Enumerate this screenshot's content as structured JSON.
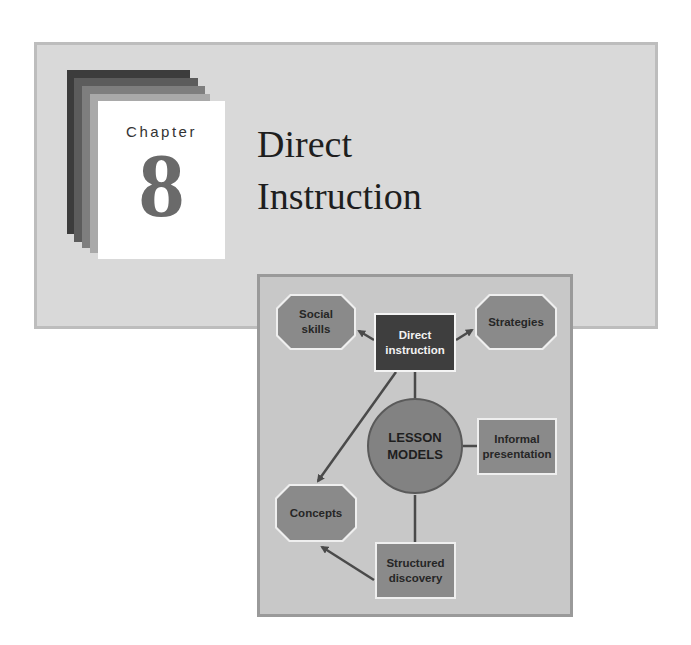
{
  "chapter": {
    "label": "Chapter",
    "number": "8",
    "title_line1": "Direct",
    "title_line2": "Instruction"
  },
  "diagram": {
    "center": {
      "label_line1": "LESSON",
      "label_line2": "MODELS"
    },
    "nodes": [
      {
        "id": "social-skills",
        "line1": "Social",
        "line2": "skills",
        "shape": "octagon"
      },
      {
        "id": "direct-instruction",
        "line1": "Direct",
        "line2": "instruction",
        "shape": "rect-dark"
      },
      {
        "id": "strategies",
        "line1": "Strategies",
        "line2": "",
        "shape": "octagon"
      },
      {
        "id": "informal-presentation",
        "line1": "Informal",
        "line2": "presentation",
        "shape": "rect"
      },
      {
        "id": "concepts",
        "line1": "Concepts",
        "line2": "",
        "shape": "octagon"
      },
      {
        "id": "structured-discovery",
        "line1": "Structured",
        "line2": "discovery",
        "shape": "rect"
      }
    ]
  },
  "colors": {
    "banner_bg": "#d9d9d9",
    "diagram_bg": "#c8c8c8",
    "node_fill": "#8a8a8a",
    "dark_node_fill": "#3e3e3e",
    "chapter_number": "#6a6a6a",
    "line": "#4a4a4a"
  }
}
